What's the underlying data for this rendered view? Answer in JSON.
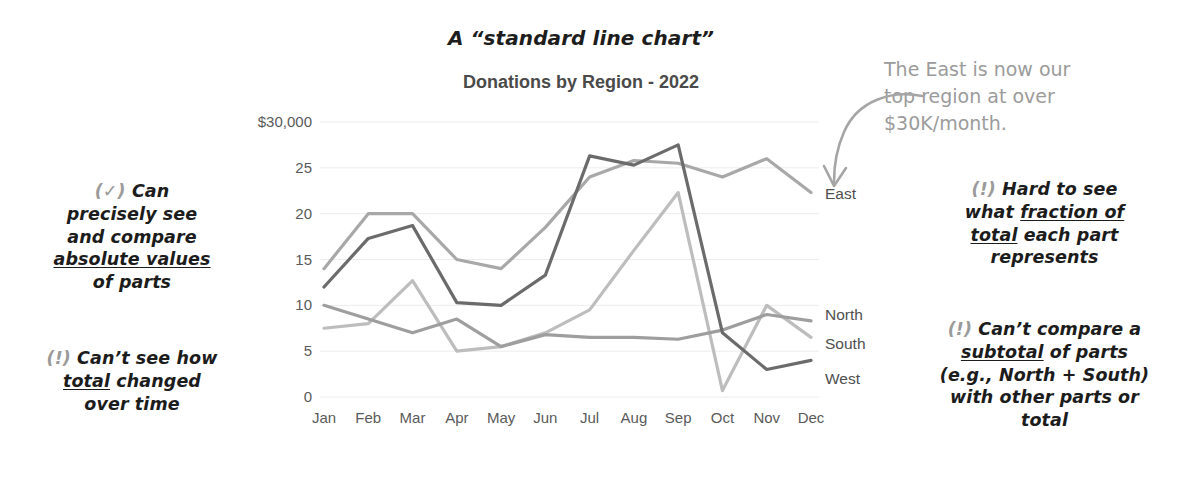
{
  "titles": {
    "hand_title": "A “standard line chart”",
    "chart_title": "Donations by Region - 2022"
  },
  "callout": {
    "line1": "The East is now our",
    "line2": "top region at over",
    "line3": "$30K/month.",
    "color": "#9b9b9b",
    "arrow_icon": "curved-arrow-icon"
  },
  "notes": {
    "left_1": {
      "marker": "(✓)",
      "l1_pre": "Can",
      "l2": "precisely see",
      "l3": "and compare",
      "l4_u": "absolute values",
      "l5": "of parts"
    },
    "left_2": {
      "marker": "(!)",
      "l1_pre": "Can’t see how",
      "l2_u": "total",
      "l2_post": "changed",
      "l3": "over time"
    },
    "right_1": {
      "marker": "(!)",
      "l1_pre": "Hard to see",
      "l2_pre": "what",
      "l2_u": "fraction of",
      "l3_u": "total",
      "l3_post": "each part",
      "l4": "represents"
    },
    "right_2": {
      "marker": "(!)",
      "l1_pre": "Can’t compare a",
      "l2_u": "subtotal",
      "l2_post": "of parts",
      "l3": "(e.g., North + South)",
      "l4": "with other parts or",
      "l5": "total"
    }
  },
  "chart_data": {
    "type": "line",
    "title": "Donations by Region - 2022",
    "xlabel": "",
    "ylabel": "",
    "ylim": [
      0,
      30
    ],
    "yticks": [
      0,
      5,
      10,
      15,
      20,
      25,
      30
    ],
    "ytick_labels": [
      "0",
      "5",
      "10",
      "15",
      "20",
      "25",
      "$30,000"
    ],
    "grid": true,
    "legend_position": "right-inline",
    "categories": [
      "Jan",
      "Feb",
      "Mar",
      "Apr",
      "May",
      "Jun",
      "Jul",
      "Aug",
      "Sep",
      "Oct",
      "Nov",
      "Dec"
    ],
    "series": [
      {
        "name": "East",
        "color": "#a8a8a8",
        "values": [
          14.0,
          20.0,
          20.0,
          15.0,
          14.0,
          18.5,
          24.0,
          25.8,
          25.5,
          24.0,
          26.0,
          22.3
        ]
      },
      {
        "name": "North",
        "color": "#9e9e9e",
        "values": [
          10.0,
          8.5,
          7.0,
          8.5,
          5.5,
          6.8,
          6.5,
          6.5,
          6.3,
          7.3,
          9.0,
          8.3
        ]
      },
      {
        "name": "South",
        "color": "#bdbdbd",
        "values": [
          7.5,
          8.0,
          12.7,
          5.0,
          5.5,
          7.0,
          9.5,
          16.0,
          22.3,
          0.7,
          10.0,
          6.5
        ]
      },
      {
        "name": "West",
        "color": "#6b6b6b",
        "values": [
          12.0,
          17.3,
          18.7,
          10.3,
          10.0,
          13.3,
          26.3,
          25.3,
          27.5,
          7.0,
          3.0,
          4.0
        ]
      }
    ]
  }
}
